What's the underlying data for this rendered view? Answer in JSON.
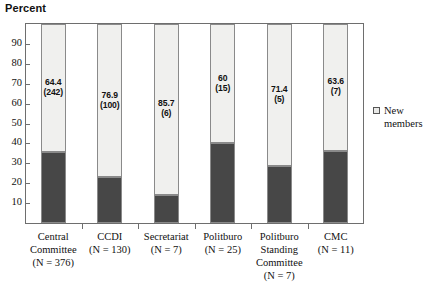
{
  "chart_data": {
    "type": "bar",
    "title": "",
    "ylabel": "Percent",
    "xlabel": "",
    "ylim": [
      0,
      100
    ],
    "ytick_labels": [
      "90",
      "80",
      "70",
      "60",
      "50",
      "40",
      "30",
      "20",
      "10"
    ],
    "yticks": [
      90,
      80,
      70,
      60,
      50,
      40,
      30,
      20,
      10
    ],
    "grid": false,
    "stacked": true,
    "legend_position": "right",
    "legend": [
      "New members"
    ],
    "categories": [
      "Central Committee",
      "CCDI",
      "Secretariat",
      "Politburo",
      "Politburo Standing Committee",
      "CMC"
    ],
    "category_label_lines": [
      [
        "Central",
        "Committee",
        "(N = 376)"
      ],
      [
        "CCDI",
        "(N = 130)"
      ],
      [
        "Secretariat",
        "(N = 7)"
      ],
      [
        "Politburo",
        "(N = 25)"
      ],
      [
        "Politburo",
        "Standing",
        "Committee",
        "(N = 7)"
      ],
      [
        "CMC",
        "(N = 11)"
      ]
    ],
    "series": [
      {
        "name": "New members",
        "color": "#f0f0ee",
        "values": [
          64.4,
          76.9,
          85.7,
          60,
          71.4,
          63.6
        ],
        "counts": [
          242,
          100,
          6,
          15,
          5,
          7
        ]
      },
      {
        "name": "Incumbent members",
        "color": "#474747",
        "values": [
          35.6,
          23.1,
          14.3,
          40,
          28.6,
          36.4
        ]
      }
    ],
    "data_labels": [
      {
        "percent": "64.4",
        "count": "(242)"
      },
      {
        "percent": "76.9",
        "count": "(100)"
      },
      {
        "percent": "85.7",
        "count": "(6)"
      },
      {
        "percent": "60",
        "count": "(15)"
      },
      {
        "percent": "71.4",
        "count": "(5)"
      },
      {
        "percent": "63.6",
        "count": "(7)"
      }
    ],
    "colors": {
      "new_members": "#f0f0ee",
      "incumbents": "#474747",
      "axis": "#6e6e6e",
      "text": "#111111",
      "background": "#ffffff"
    }
  },
  "legend": {
    "label": "New members"
  }
}
